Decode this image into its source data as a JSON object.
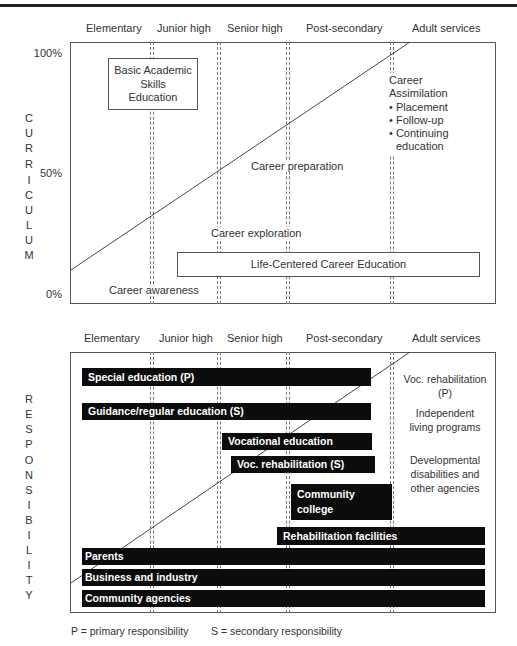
{
  "stages": [
    "Elementary",
    "Junior high",
    "Senior high",
    "Post-secondary",
    "Adult services"
  ],
  "curriculum_panel": {
    "axis_label_letters": [
      "C",
      "U",
      "R",
      "R",
      "I",
      "C",
      "U",
      "L",
      "U",
      "M"
    ],
    "axis_label": "CURRICULUM",
    "y_ticks": [
      "100%",
      "50%",
      "0%"
    ],
    "basic_box": [
      "Basic Academic",
      "Skills",
      "Education"
    ],
    "career_assimilation": {
      "title": [
        "Career",
        "Assimilation"
      ],
      "bullets": [
        "• Placement",
        "• Follow-up",
        "• Continuing",
        "education"
      ]
    },
    "career_preparation": "Career preparation",
    "career_exploration": "Career exploration",
    "career_awareness": "Career awareness",
    "lcce_box": "Life-Centered Career Education"
  },
  "responsibility_panel": {
    "axis_label_letters": [
      "R",
      "E",
      "S",
      "P",
      "O",
      "N",
      "S",
      "I",
      "B",
      "I",
      "L",
      "I",
      "T",
      "Y"
    ],
    "axis_label": "RESPONSIBILITY",
    "bars": [
      {
        "label": "Special education (P)"
      },
      {
        "label": "Guidance/regular education (S)"
      },
      {
        "label": "Vocational education"
      },
      {
        "label": "Voc. rehabilitation (S)"
      },
      {
        "label": "Community",
        "label2": "college"
      },
      {
        "label": "Rehabilitation facilities"
      },
      {
        "label": "Parents"
      },
      {
        "label": "Business and industry"
      },
      {
        "label": "Community agencies"
      }
    ],
    "adult_services_text": {
      "voc_rehab": [
        "Voc. rehabilitation",
        "(P)"
      ],
      "independent": [
        "Independent",
        "living programs"
      ],
      "developmental": [
        "Developmental",
        "disabilities and",
        "other agencies"
      ]
    }
  },
  "legend": {
    "primary": "P = primary responsibility",
    "secondary": "S = secondary responsibility"
  }
}
